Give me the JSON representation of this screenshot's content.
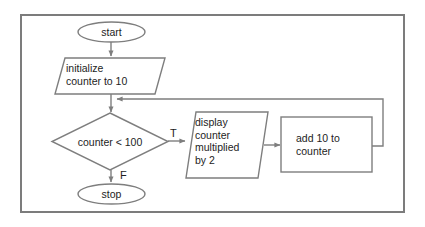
{
  "diagram": {
    "frame": {
      "border_color": "#7c7c7c",
      "background": "#ffffff"
    },
    "stroke_color": "#7e7e7e",
    "text_color": "#1d1d1d",
    "nodes": [
      {
        "id": "start",
        "kind": "terminator",
        "label": "start"
      },
      {
        "id": "init",
        "kind": "input-output",
        "label": "initialize\ncounter to 10"
      },
      {
        "id": "decision",
        "kind": "decision",
        "label": "counter < 100"
      },
      {
        "id": "display",
        "kind": "input-output",
        "label": "display\ncounter\nmultiplied\nby 2"
      },
      {
        "id": "increment",
        "kind": "process",
        "label": "add 10 to\ncounter"
      },
      {
        "id": "stop",
        "kind": "terminator",
        "label": "stop"
      }
    ],
    "edge_labels": {
      "true": "T",
      "false": "F"
    },
    "edges": [
      {
        "from": "start",
        "to": "init",
        "label": ""
      },
      {
        "from": "init",
        "to": "decision",
        "label": ""
      },
      {
        "from": "decision",
        "to": "display",
        "label": "T"
      },
      {
        "from": "display",
        "to": "increment",
        "label": ""
      },
      {
        "from": "increment",
        "to": "decision",
        "label": ""
      },
      {
        "from": "decision",
        "to": "stop",
        "label": "F"
      }
    ]
  }
}
